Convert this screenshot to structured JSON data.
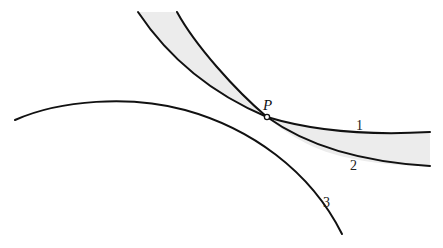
{
  "diagram": {
    "point_label": "P",
    "curves": [
      {
        "id": "1",
        "label": "1"
      },
      {
        "id": "2",
        "label": "2"
      },
      {
        "id": "3",
        "label": "3"
      }
    ],
    "shading_color": "#ececec",
    "stroke_color": "#111111"
  }
}
